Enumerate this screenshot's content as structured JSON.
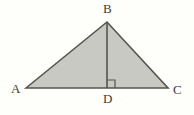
{
  "figure": {
    "kind": "euclidean-geometry-diagram",
    "background_color": "#fefefa",
    "fill_color": "#c9c9c4",
    "stroke_color": "#55554f",
    "label_color": "#3d3d39",
    "stroke_width": 1.6,
    "labels": {
      "a": "A",
      "b": "B",
      "c": "C",
      "d": "D"
    },
    "points": {
      "A": {
        "x": 26,
        "y": 88
      },
      "B": {
        "x": 107,
        "y": 22
      },
      "C": {
        "x": 168,
        "y": 88
      },
      "D": {
        "x": 107,
        "y": 88
      }
    },
    "segments": [
      {
        "name": "AB",
        "from": "A",
        "to": "B"
      },
      {
        "name": "BC",
        "from": "B",
        "to": "C"
      },
      {
        "name": "AC",
        "from": "A",
        "to": "C"
      },
      {
        "name": "BD",
        "from": "B",
        "to": "D"
      }
    ],
    "right_angle_marker": {
      "at": "D",
      "side": "right",
      "size": 8,
      "angle_label": "90"
    },
    "geometry_paths": {
      "triangle": "M 26 88 L 107 22 L 168 88 Z",
      "altitude": "M 107 22 L 107 88",
      "right_angle": "M 107 80 L 115 80 L 115 88"
    }
  }
}
